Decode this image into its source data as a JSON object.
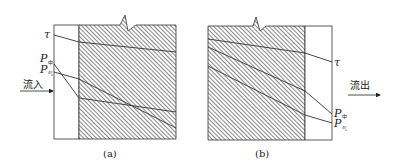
{
  "figure": {
    "panels": [
      {
        "id": "a",
        "caption": "(a)",
        "flow_label": "流入",
        "labels": {
          "tau": "τ",
          "p1": "P",
          "p1_sub": "中",
          "p2": "P",
          "p2_sub": "气"
        }
      },
      {
        "id": "b",
        "caption": "(b)",
        "flow_label": "流出",
        "labels": {
          "tau": "τ",
          "p1": "P",
          "p1_sub": "中",
          "p2": "P",
          "p2_sub": "气"
        }
      }
    ],
    "colors": {
      "stroke": "#333333",
      "hatch": "#555555",
      "background": "#ffffff"
    }
  }
}
